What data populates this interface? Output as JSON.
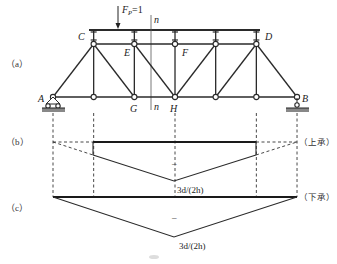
{
  "figure": {
    "panels": [
      {
        "id": "a",
        "label": "（a）"
      },
      {
        "id": "b",
        "label": "（b）",
        "load_case": "（上承）",
        "sign": "–",
        "peak_value": "3d/(2h)"
      },
      {
        "id": "c",
        "label": "（c）",
        "load_case": "（下承）",
        "sign": "–",
        "peak_value": "3d/(2h)"
      }
    ],
    "load": {
      "symbol": "F",
      "subscript": "P",
      "value": "=1"
    },
    "section": {
      "label_top": "n",
      "label_bottom": "n"
    },
    "nodes": {
      "A": "A",
      "B": "B",
      "C": "C",
      "D": "D",
      "E": "E",
      "F": "F",
      "G": "G",
      "H": "H"
    },
    "truss": {
      "panel_count": 6,
      "bottom_nodes": [
        0,
        1,
        2,
        3,
        4,
        5,
        6
      ],
      "top_nodes": [
        1,
        2,
        3,
        4,
        5
      ]
    },
    "influence_lines": {
      "b": {
        "ordinates_at_panel_points": [
          0,
          0.5,
          null,
          1,
          null,
          0.5,
          0
        ],
        "loaded_from_panel": 1,
        "loaded_to_panel": 5,
        "peak": "3d/(2h)",
        "sign": "negative"
      },
      "c": {
        "ordinates_at_panel_points": [
          0,
          null,
          null,
          1,
          null,
          null,
          0
        ],
        "loaded_from_panel": 0,
        "loaded_to_panel": 6,
        "peak": "3d/(2h)",
        "sign": "negative"
      }
    }
  }
}
